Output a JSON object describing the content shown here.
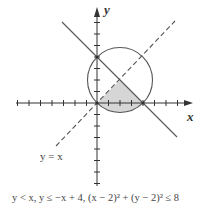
{
  "diagram": {
    "axes": {
      "x_label": "x",
      "y_label": "y"
    },
    "line_labels": {
      "dashed_line": "y = x"
    },
    "caption": "y < x, y ≤ −x + 4, (x − 2)² + (y − 2)² ≤ 8",
    "elements": {
      "circle": {
        "center": [
          2,
          2
        ],
        "radius_squared": 8
      },
      "solid_line": "y = -x + 4",
      "dashed_line": "y = x",
      "shaded_region": "y < x, y ≤ -x + 4, inside circle"
    },
    "colors": {
      "axis": "#333333",
      "line": "#555555",
      "shade": "#d6d6d6"
    }
  }
}
